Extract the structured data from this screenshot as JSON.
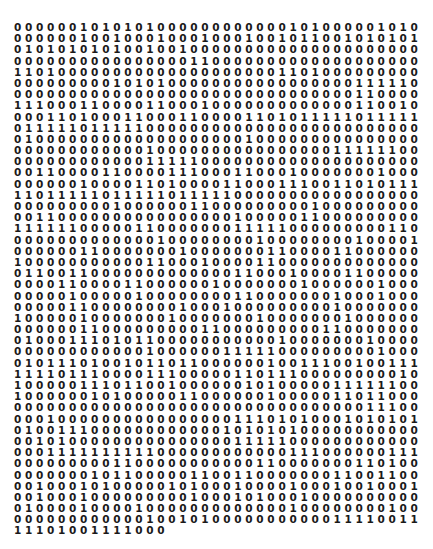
{
  "title": "",
  "binary_rows": [
    "0000001010101000000000000101000001010",
    "0000001001000100010001001011001010101",
    "0101010101001001000000000000000000000",
    "0000000000000000110000000000000000000",
    "1101000000000000000000001101000000000",
    "0000000001010100000000000000000111110",
    "0000000000000000000000000000000110000",
    "1110001100001100010000000000000110010",
    "0001101000110001100001101011111011111",
    "0111110111110000000000000000000000000",
    "0100000000000000000001000000000000000",
    "0000000000001000000000000000011111100",
    "0000000000001111100000000000000000000",
    "0011000011000011100011000100000001000",
    "0000001000011010000110001110011010111",
    "1101111101111101111100000000000000000",
    "0000000001000000110000000001000000000",
    "0011000000000000000010000011000000000",
    "1111110000011000000011111000000000110",
    "0000000000000100000000100000000100001",
    "0000001100000001000000011000011000000",
    "1000000000001100010000110000000000000",
    "0110011000000000000011000100001100000",
    "0000110000110000001000000010000001000",
    "0000010000010000000011000000010001000",
    "0000011000000001000100000000010000000",
    "1000001000000010000000100000001000000",
    "0000001100000000011000000000110000000",
    "0100011101011000000000001000000010000",
    "0000000000001000000111110000000001000",
    "0101110100101101100000010011100100111",
    "1111011100001110000011011100000000010",
    "1000001110110010000001010000011111100",
    "1000000101000001100000010000011011000",
    "0000000000000000000000000000000011100",
    "0001000000000000000011101010001010101",
    "0100111000000000000101010100000000000",
    "0010100000000000000011111000000000000",
    "0001111111111000000000000111000000111",
    "0000000001100000000000110000000110100",
    "0000000101100000110011000000011001100",
    "0010001010000010100010000100010010001",
    "0010001000000000100010100010000000000",
    "0100001000010000000000000100000000100",
    "0000000000001001010000000000011110011",
    "11101001111000"
  ]
}
